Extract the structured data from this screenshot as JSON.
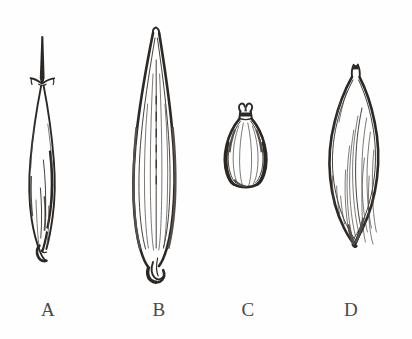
{
  "figure": {
    "background_color": "#ffffff",
    "ink_color": "#2b2825",
    "label_color": "#4a4a4a",
    "style": "black-and-white pen-and-ink botanical illustration"
  },
  "specimens": [
    {
      "id": "A",
      "label": "A",
      "name": "awned-narrow-floret",
      "description": "Very narrow elongate floret with a long straight terminal awn and two short divergent lateral bristles at the awn base; body slender, tapering to a rounded hooked callus at the base with dense dark shading along the right margin.",
      "shape": "linear-lanceolate",
      "apex": "long straight awn with two spreading lateral bristles",
      "base": "rounded curved callus hooked to the left",
      "relative_height": "tall-slender"
    },
    {
      "id": "B",
      "label": "B",
      "name": "lanceolate-spikelet",
      "description": "Long lanceolate spikelet, the largest of the four, with a narrow rounded apex, parallel longitudinal veins running the full length of the body, and a thick dark rounded hooked base.",
      "shape": "lanceolate",
      "apex": "narrow rounded acute tip",
      "base": "thick dark rounded hook",
      "relative_height": "tallest"
    },
    {
      "id": "C",
      "label": "C",
      "name": "urceolate-utricle",
      "description": "Small urn-shaped (obovoid) body, widest below the middle, constricted into a short neck bearing two small curled horn-like projections; margins heavily shaded, centre pale.",
      "shape": "obovoid-urceolate",
      "apex": "short neck with two curled horn-like projections",
      "base": "broad truncate-rounded",
      "relative_height": "smallest"
    },
    {
      "id": "D",
      "label": "D",
      "name": "fusiform-grain",
      "description": "Broad fusiform grain with a short pointed beak at the apex, a plump rounded body and a tapering base; the lower right side bears dense diagonal hatching indicating curvature.",
      "shape": "fusiform-ellipsoid",
      "apex": "short notched beak",
      "base": "tapering rounded point",
      "relative_height": "medium-broad"
    }
  ],
  "labels": {
    "a": "A",
    "b": "B",
    "c": "C",
    "d": "D"
  }
}
